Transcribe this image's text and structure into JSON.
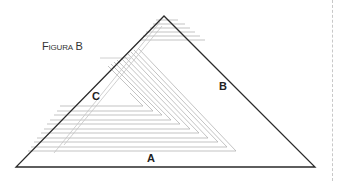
{
  "figure": {
    "title_first": "F",
    "title_rest": "IGURA",
    "title_letter": "B",
    "labels": {
      "a": "A",
      "b": "B",
      "c": "C"
    },
    "colors": {
      "outline": "#2a2a2a",
      "inner_lines": "#b0b0b0",
      "border": "#c8c8c8"
    }
  }
}
